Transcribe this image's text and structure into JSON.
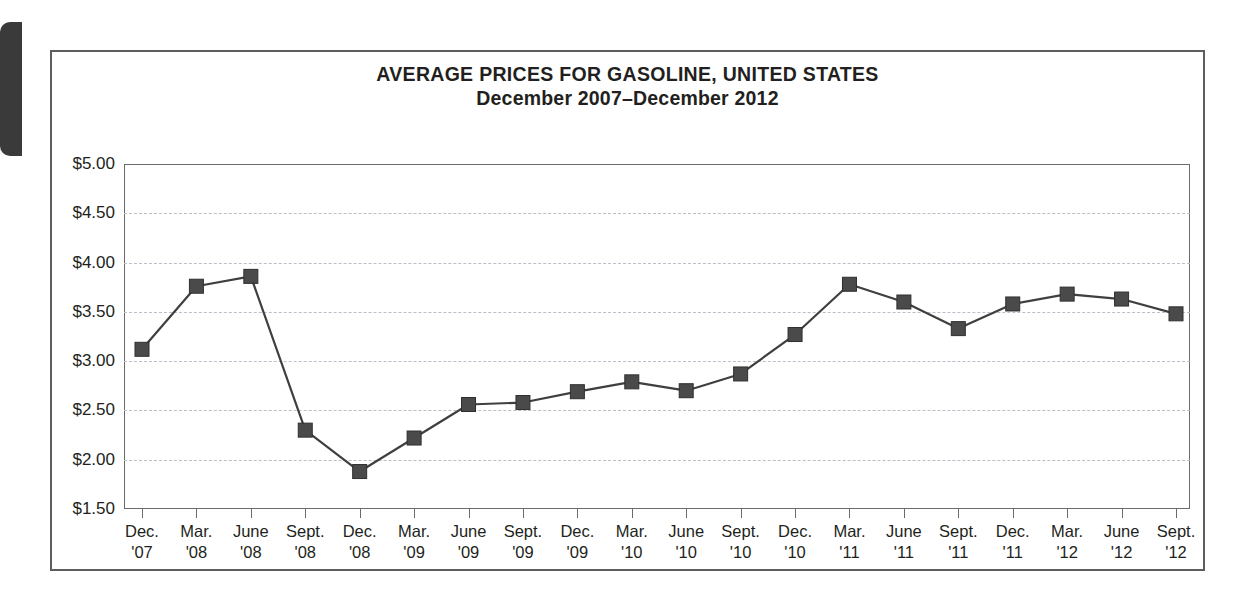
{
  "figure": {
    "title": "AVERAGE PRICES FOR GASOLINE, UNITED STATES",
    "subtitle": "December 2007–December 2012"
  },
  "colors": {
    "marker_fill": "#4a4a4a",
    "line": "#3f3f3f",
    "gridline": "#b9bfc9",
    "axis": "#6b6b6b",
    "frame": "#5d5d5d",
    "text": "#231f20"
  },
  "chart_data": {
    "type": "line",
    "title": "AVERAGE PRICES FOR GASOLINE, UNITED STATES",
    "subtitle": "December 2007–December 2012",
    "xlabel": "",
    "ylabel": "",
    "ylim": [
      1.5,
      5.0
    ],
    "ytick_step": 0.5,
    "grid": true,
    "legend": "none",
    "marker": "square",
    "ytick_labels": [
      "$5.00",
      "$4.50",
      "$4.00",
      "$3.50",
      "$3.00",
      "$2.50",
      "$2.00",
      "$1.50"
    ],
    "ytick_values": [
      5.0,
      4.5,
      4.0,
      3.5,
      3.0,
      2.5,
      2.0,
      1.5
    ],
    "categories": [
      {
        "month": "Dec.",
        "year": "'07"
      },
      {
        "month": "Mar.",
        "year": "'08"
      },
      {
        "month": "June",
        "year": "'08"
      },
      {
        "month": "Sept.",
        "year": "'08"
      },
      {
        "month": "Dec.",
        "year": "'08"
      },
      {
        "month": "Mar.",
        "year": "'09"
      },
      {
        "month": "June",
        "year": "'09"
      },
      {
        "month": "Sept.",
        "year": "'09"
      },
      {
        "month": "Dec.",
        "year": "'09"
      },
      {
        "month": "Mar.",
        "year": "'10"
      },
      {
        "month": "June",
        "year": "'10"
      },
      {
        "month": "Sept.",
        "year": "'10"
      },
      {
        "month": "Dec.",
        "year": "'10"
      },
      {
        "month": "Mar.",
        "year": "'11"
      },
      {
        "month": "June",
        "year": "'11"
      },
      {
        "month": "Sept.",
        "year": "'11"
      },
      {
        "month": "Dec.",
        "year": "'11"
      },
      {
        "month": "Mar.",
        "year": "'12"
      },
      {
        "month": "June",
        "year": "'12"
      },
      {
        "month": "Sept.",
        "year": "'12"
      }
    ],
    "values": [
      3.12,
      3.76,
      3.86,
      2.3,
      1.88,
      2.22,
      2.56,
      2.58,
      2.69,
      2.79,
      2.7,
      2.87,
      3.27,
      3.78,
      3.6,
      3.33,
      3.58,
      3.68,
      3.63,
      3.48
    ]
  }
}
